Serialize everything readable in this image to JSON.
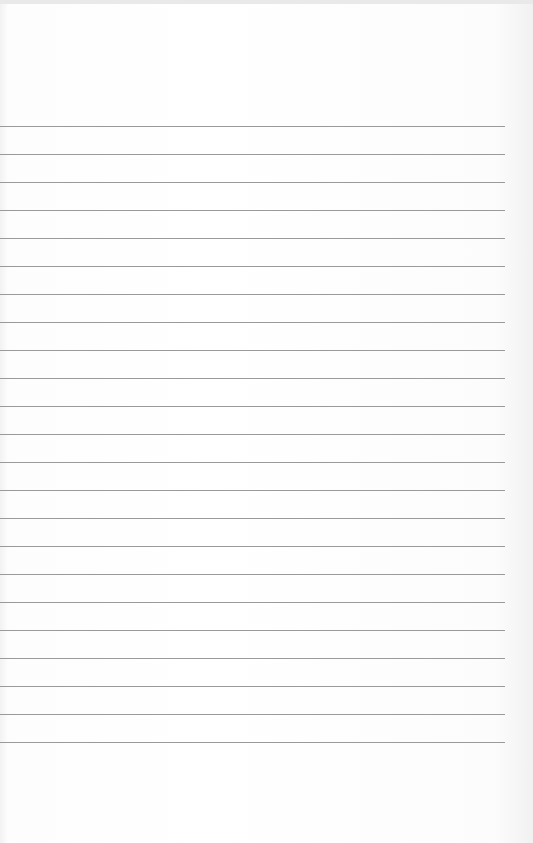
{
  "document": {
    "type": "blank lined paper",
    "line_count": 23,
    "first_line_y": 126,
    "line_spacing": 28.0,
    "line_color": "#9a9a9a",
    "paper_color": "#ffffff",
    "text_lines": []
  }
}
